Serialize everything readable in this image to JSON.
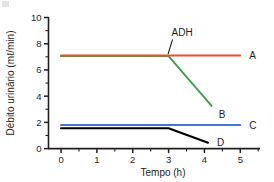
{
  "chart_data": {
    "type": "line",
    "title": "",
    "xlabel": "Tempo (h)",
    "ylabel": "Débito urinário (mℓ/min)",
    "xlim": [
      -0.35,
      5.55
    ],
    "ylim": [
      0,
      10
    ],
    "xticks": [
      0,
      1,
      2,
      3,
      4,
      5
    ],
    "xtick_labels": [
      "0",
      "1",
      "2",
      "3",
      "4",
      "5"
    ],
    "x_minor_step": 0.5,
    "yticks": [
      0,
      2,
      4,
      6,
      8,
      10
    ],
    "ytick_labels": [
      "0",
      "2",
      "4",
      "6",
      "8",
      "10"
    ],
    "y_minor_step": 1,
    "grid": false,
    "legend_position": "right-inline-end-labels",
    "annotations": [
      {
        "text": "ADH",
        "x": 3.0,
        "y": 8.6,
        "points_to_x": 3.0,
        "points_to_y": 7.1
      }
    ],
    "series": [
      {
        "name": "A",
        "color": "#ee4d2e",
        "label": "A",
        "label_x": 5.25,
        "label_y": 7.1,
        "x": [
          0,
          3,
          5
        ],
        "values": [
          7.1,
          7.1,
          7.1
        ]
      },
      {
        "name": "B",
        "color": "#3aa34a",
        "label": "B",
        "label_x": 4.4,
        "label_y": 2.6,
        "x": [
          0,
          3,
          4.2
        ],
        "values": [
          7.05,
          7.05,
          3.25
        ]
      },
      {
        "name": "C",
        "color": "#4876d6",
        "label": "C",
        "label_x": 5.25,
        "label_y": 1.8,
        "x": [
          0,
          3,
          5
        ],
        "values": [
          1.8,
          1.8,
          1.8
        ]
      },
      {
        "name": "D",
        "color": "#000000",
        "label": "D",
        "label_x": 4.35,
        "label_y": 0.5,
        "x": [
          0,
          3,
          4.1
        ],
        "values": [
          1.55,
          1.55,
          0.45
        ]
      }
    ]
  }
}
